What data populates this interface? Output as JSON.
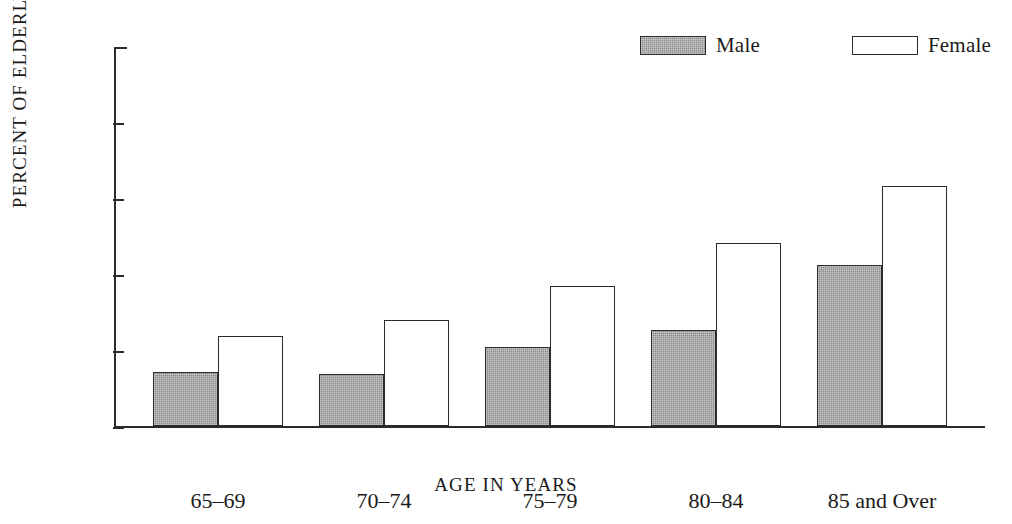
{
  "chart_data": {
    "type": "bar",
    "title": "",
    "xlabel": "AGE IN YEARS",
    "ylabel": "PERCENT OF ELDERLY",
    "categories": [
      "65–69",
      "70–74",
      "75–79",
      "80–84",
      "85 and Over"
    ],
    "series": [
      {
        "name": "Male",
        "color": "#8d8d8d",
        "values": [
          14.3,
          13.8,
          20.8,
          25.4,
          42.6
        ]
      },
      {
        "name": "Female",
        "color": "#ffffff",
        "values": [
          23.9,
          28.0,
          36.9,
          48.3,
          63.4
        ]
      }
    ],
    "ylim": [
      0,
      100
    ],
    "yticks": [
      0,
      20,
      40,
      60,
      80,
      100
    ],
    "ytick_labels": [
      "0",
      "20",
      "40",
      "60",
      "80",
      "100"
    ],
    "grid": false,
    "legend_position": "top-right",
    "legend": [
      {
        "label": "Male",
        "swatch": "gray-filled-rectangle"
      },
      {
        "label": "Female",
        "swatch": "white-outlined-rectangle"
      }
    ],
    "colors": {
      "male_fill": "#8d8d8d",
      "female_fill": "#ffffff",
      "outline": "#2b2b2b",
      "background": "#ffffff"
    }
  }
}
